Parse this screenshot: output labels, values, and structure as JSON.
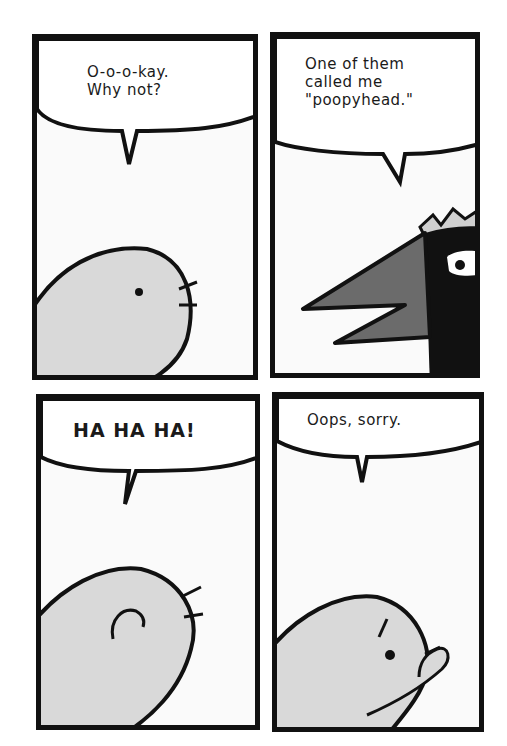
{
  "comic": {
    "panels": [
      {
        "id": 1,
        "speech": "O-o-o-kay.\nWhy not?",
        "character": "gray-blob-creature",
        "expression": "neutral"
      },
      {
        "id": 2,
        "speech": "One of them\ncalled me\n\"poopyhead.\"",
        "character": "black-crowned-bird",
        "expression": "annoyed"
      },
      {
        "id": 3,
        "speech": "HA HA HA!",
        "character": "gray-blob-creature",
        "expression": "laughing"
      },
      {
        "id": 4,
        "speech": "Oops, sorry.",
        "character": "gray-blob-creature",
        "expression": "embarrassed-covering-mouth"
      }
    ],
    "colors": {
      "ink": "#111111",
      "panel_bg": "#fafafa",
      "creature_fill": "#d9d9d9",
      "beak_fill": "#6b6b6b",
      "crown_fill": "#d0d0d0"
    }
  }
}
